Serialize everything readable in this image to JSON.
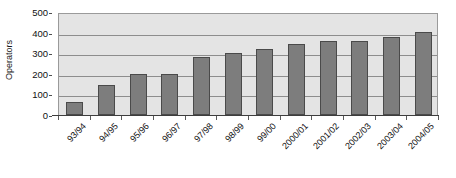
{
  "chart_data": {
    "type": "bar",
    "title": "",
    "xlabel": "",
    "ylabel": "Operators",
    "categories": [
      "93/94",
      "94/95",
      "95/96",
      "96/97",
      "97/98",
      "98/99",
      "99/00",
      "2000/01",
      "2001/02",
      "2002/03",
      "2003/04",
      "2004/05"
    ],
    "values": [
      65,
      145,
      198,
      200,
      280,
      300,
      320,
      345,
      360,
      360,
      378,
      405
    ],
    "ylim": [
      0,
      500
    ],
    "yticks": [
      0,
      100,
      200,
      300,
      400,
      500
    ],
    "ytick_labels": [
      "0",
      "100",
      "200",
      "300",
      "400",
      "500"
    ],
    "grid": true,
    "legend": false,
    "series": [
      {
        "name": "Operators",
        "values": [
          65,
          145,
          198,
          200,
          280,
          300,
          320,
          345,
          360,
          360,
          378,
          405
        ]
      }
    ]
  },
  "colors": {
    "bar_fill": "#7d7d7d",
    "bar_stroke": "#4a4a4a",
    "plot_background": "#e4e4e4",
    "plot_border": "#9a9a9a",
    "gridline": "#8d8d8d",
    "axis": "#3d3d3d",
    "text": "#111111",
    "page_background": "#ffffff"
  }
}
